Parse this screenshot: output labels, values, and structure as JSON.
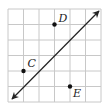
{
  "diagram": {
    "type": "grid-with-line-and-points",
    "grid": {
      "cols": 6,
      "rows": 6,
      "color": "#c8c8c8"
    },
    "line": {
      "from": [
        0,
        6
      ],
      "to": [
        6,
        0
      ],
      "arrows": "both",
      "color": "#222222"
    },
    "points": [
      {
        "name": "D",
        "label": "D",
        "grid": [
          3,
          1
        ]
      },
      {
        "name": "C",
        "label": "C",
        "grid": [
          1,
          4
        ]
      },
      {
        "name": "E",
        "label": "E",
        "grid": [
          4,
          5
        ]
      }
    ]
  }
}
